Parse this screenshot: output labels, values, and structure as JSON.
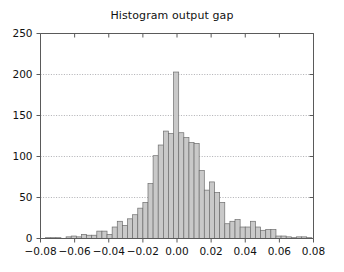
{
  "chart_data": {
    "type": "bar",
    "title": "Histogram output gap",
    "xlabel": "",
    "ylabel": "",
    "xlim": [
      -0.08,
      0.08
    ],
    "ylim": [
      0,
      250
    ],
    "grid": true,
    "legend": null,
    "bin_width": 0.003,
    "xticks": [
      -0.08,
      -0.06,
      -0.04,
      -0.02,
      0.0,
      0.02,
      0.04,
      0.06,
      0.08
    ],
    "xtick_labels": [
      "-0.08",
      "-0.06",
      "-0.04",
      "-0.02",
      "0.00",
      "0.02",
      "0.04",
      "0.06",
      "0.08"
    ],
    "yticks": [
      0,
      50,
      100,
      150,
      200,
      250
    ],
    "ytick_labels": [
      "0",
      "50",
      "100",
      "150",
      "200",
      "250"
    ],
    "bar_fill_color": "#c9c9c9",
    "bar_edge_color": "#6e6e6e",
    "grid_color": "#9a9aa0",
    "axis_color": "#5a5a5a",
    "categories": [
      -0.0785,
      -0.0755,
      -0.0725,
      -0.0695,
      -0.0665,
      -0.0635,
      -0.0605,
      -0.0575,
      -0.0545,
      -0.0515,
      -0.0485,
      -0.0455,
      -0.0425,
      -0.0395,
      -0.0365,
      -0.0335,
      -0.0305,
      -0.0275,
      -0.0245,
      -0.0215,
      -0.0185,
      -0.0155,
      -0.0125,
      -0.0095,
      -0.0065,
      -0.0035,
      -0.0005,
      0.0025,
      0.0055,
      0.0085,
      0.0115,
      0.0145,
      0.0175,
      0.0205,
      0.0235,
      0.0265,
      0.0295,
      0.0325,
      0.0355,
      0.0385,
      0.0415,
      0.0445,
      0.0475,
      0.0505,
      0.0535,
      0.0565,
      0.0595,
      0.0625,
      0.0655,
      0.0685,
      0.0715,
      0.0745,
      0.0775
    ],
    "values": [
      0,
      1,
      1,
      1,
      0,
      2,
      3,
      2,
      5,
      4,
      4,
      9,
      9,
      5,
      14,
      21,
      16,
      24,
      29,
      37,
      44,
      67,
      101,
      114,
      131,
      128,
      203,
      129,
      123,
      117,
      116,
      83,
      59,
      69,
      56,
      44,
      18,
      21,
      23,
      14,
      14,
      21,
      14,
      10,
      11,
      11,
      3,
      3,
      2,
      1,
      2,
      2,
      1
    ]
  }
}
